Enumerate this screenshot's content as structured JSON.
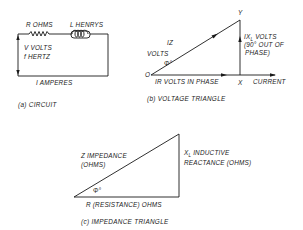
{
  "circuit": {
    "resistor_label": "R OHMS",
    "inductor_label": "L HENRYS",
    "voltage_label": "V VOLTS",
    "frequency_label": "f HERTZ",
    "current_label": "I AMPERES",
    "caption": "(a) CIRCUIT"
  },
  "voltage_triangle": {
    "vertex_y": "Y",
    "vertex_o": "O",
    "vertex_x": "X",
    "hypotenuse_label_1": "IZ",
    "hypotenuse_label_2": "VOLTS",
    "angle_label": "Φ°",
    "base_label": "IR VOLTS IN PHASE",
    "current_label": "CURRENT",
    "vertical_label_1": "IX",
    "vertical_label_sub": "L",
    "vertical_label_1b": " VOLTS",
    "vertical_label_2": "(90° OUT OF",
    "vertical_label_3": "PHASE)",
    "caption": "(b) VOLTAGE TRIANGLE"
  },
  "impedance_triangle": {
    "hypotenuse_label_1": "Z IMPEDANCE",
    "hypotenuse_label_2": "(OHMS)",
    "angle_label": "Φ°",
    "base_label": "R (RESISTANCE) OHMS",
    "vertical_label_1": "X",
    "vertical_label_sub": "L",
    "vertical_label_1b": " INDUCTIVE",
    "vertical_label_2": "REACTANCE (OHMS)",
    "caption": "(c) IMPEDANCE TRIANGLE"
  }
}
